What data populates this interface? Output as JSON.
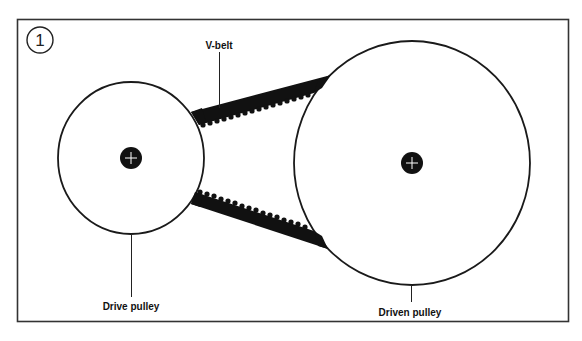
{
  "figure": {
    "number": "1",
    "colors": {
      "stroke": "#1a1a1a",
      "frame": "#333333",
      "belt": "#111111",
      "background": "#ffffff"
    }
  },
  "labels": {
    "v_belt": "V-belt",
    "drive_pulley": "Drive pulley",
    "driven_pulley": "Driven pulley"
  },
  "components": {
    "drive_pulley": {
      "cx": 131,
      "cy": 158,
      "rx": 73,
      "ry": 76,
      "hub_r": 11
    },
    "driven_pulley": {
      "cx": 412,
      "cy": 163,
      "rx": 118,
      "ry": 122,
      "hub_r": 11
    }
  }
}
